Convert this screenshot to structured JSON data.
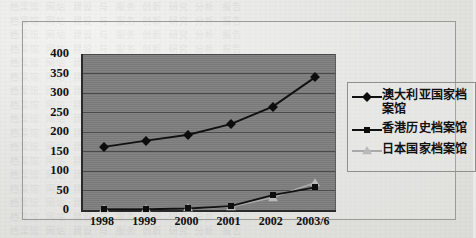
{
  "chart_data": {
    "type": "line",
    "title": "",
    "xlabel": "",
    "ylabel": "",
    "categories": [
      "1998",
      "1999",
      "2000",
      "2001",
      "2002",
      "2003/6"
    ],
    "ylim": [
      0,
      400
    ],
    "yticks": [
      "0",
      "50",
      "100",
      "150",
      "200",
      "250",
      "300",
      "350",
      "400"
    ],
    "grid": true,
    "legend_position": "right",
    "plot_background": "#7e7e7e",
    "series": [
      {
        "name": "澳大利亚国家档案馆",
        "marker": "diamond",
        "color": "#0d0d0d",
        "values": [
          162,
          178,
          193,
          220,
          265,
          340
        ]
      },
      {
        "name": "香港历史档案馆",
        "marker": "square",
        "color": "#0d0d0d",
        "values": [
          2,
          2,
          4,
          10,
          38,
          58
        ]
      },
      {
        "name": "日本国家档案馆",
        "marker": "triangle",
        "color": "#b9b9b9",
        "values": [
          3,
          3,
          4,
          8,
          32,
          70
        ]
      }
    ]
  },
  "legend": {
    "items": [
      {
        "label": "澳大利亚国家档案馆",
        "marker": "diamond-marker"
      },
      {
        "label": "香港历史档案馆",
        "marker": "square-marker"
      },
      {
        "label": "日本国家档案馆",
        "marker": "triangle-marker"
      }
    ]
  }
}
